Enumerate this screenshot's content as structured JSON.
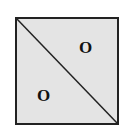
{
  "diagram": {
    "shape": "square",
    "fill_color": "#e4e4e4",
    "stroke_color": "#222222",
    "diagonal": "top-left to bottom-right",
    "labels": [
      {
        "text": "O",
        "region": "upper-right triangle"
      },
      {
        "text": "O",
        "region": "lower-left triangle"
      }
    ]
  }
}
